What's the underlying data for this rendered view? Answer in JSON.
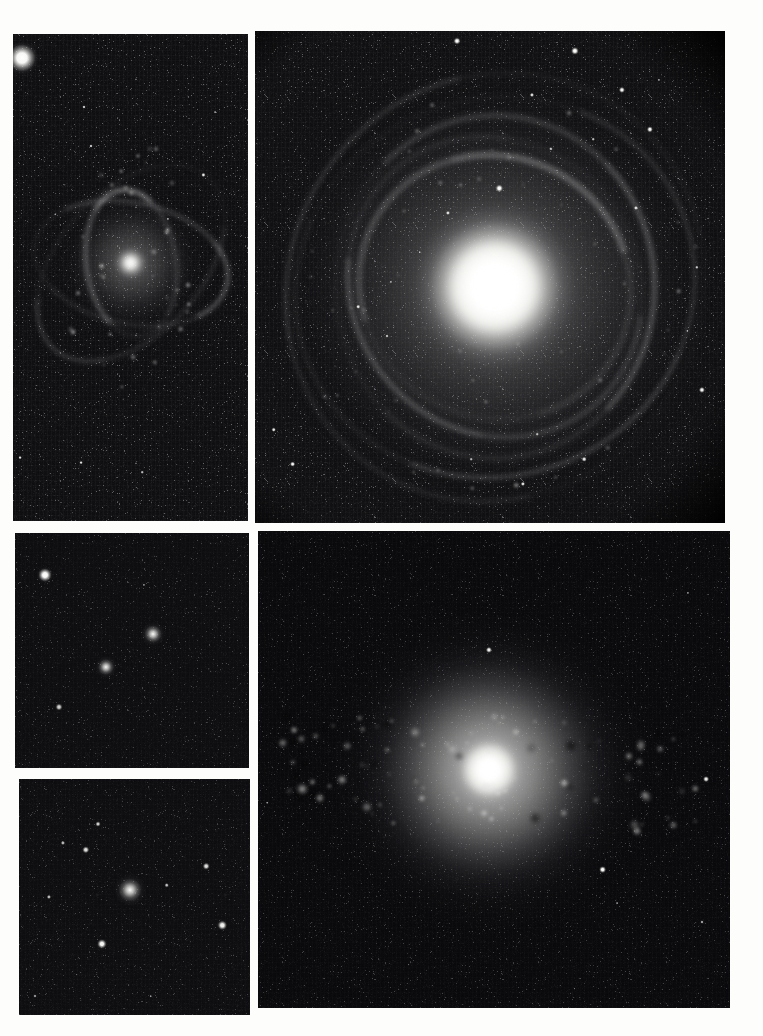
{
  "figure": {
    "kind": "astronomical-image-plate",
    "medium": "scanned photographic/CCD plate, greyscale",
    "width_px": 763,
    "height_px": 1036,
    "background_color": "#fdfdfc",
    "sky_color": "#08080a",
    "source_color": "#ffffff",
    "panel_count": 5,
    "caption": ""
  },
  "panels": [
    {
      "id": "panel-top-left",
      "name": "top-left-field",
      "position": "top-left",
      "label": "",
      "x": 13,
      "y": 34,
      "w": 235,
      "h": 487,
      "content": "Small barred/flocculent spiral galaxy low-left of centre in a sparse star field; a saturated bright star clips the upper-left corner.",
      "object_type": "spiral galaxy",
      "sky_level": "#0a0a0c",
      "grain": "strong",
      "vignette": "none",
      "stars": [
        {
          "name": "saturated-corner-star",
          "cx": 4,
          "cy": 5,
          "r": 17,
          "brightness": 1.0
        },
        {
          "name": "star",
          "cx": 30,
          "cy": 15,
          "r": 2.0,
          "brightness": 0.75
        },
        {
          "name": "star",
          "cx": 33,
          "cy": 23,
          "r": 2.0,
          "brightness": 0.72
        },
        {
          "name": "star",
          "cx": 86,
          "cy": 16,
          "r": 1.4,
          "brightness": 0.5
        },
        {
          "name": "star",
          "cx": 81,
          "cy": 29,
          "r": 2.6,
          "brightness": 0.88
        },
        {
          "name": "star",
          "cx": 66,
          "cy": 38,
          "r": 1.6,
          "brightness": 0.55
        },
        {
          "name": "star",
          "cx": 18,
          "cy": 37,
          "r": 1.2,
          "brightness": 0.4
        },
        {
          "name": "star",
          "cx": 22,
          "cy": 31,
          "r": 1.1,
          "brightness": 0.35
        },
        {
          "name": "star",
          "cx": 3,
          "cy": 87,
          "r": 2.4,
          "brightness": 0.82
        },
        {
          "name": "star",
          "cx": 29,
          "cy": 88,
          "r": 2.4,
          "brightness": 0.85
        },
        {
          "name": "star",
          "cx": 55,
          "cy": 90,
          "r": 1.8,
          "brightness": 0.6
        },
        {
          "name": "star",
          "cx": 70,
          "cy": 70,
          "r": 1.0,
          "brightness": 0.3
        },
        {
          "name": "star",
          "cx": 47,
          "cy": 75,
          "r": 0.9,
          "brightness": 0.26
        },
        {
          "name": "star",
          "cx": 62,
          "cy": 59,
          "r": 1.0,
          "brightness": 0.28
        },
        {
          "name": "star",
          "cx": 90,
          "cy": 63,
          "r": 0.9,
          "brightness": 0.24
        }
      ],
      "galaxy": {
        "name": "spiral-galaxy-small",
        "cx": 50,
        "cy": 47,
        "core_r": 7,
        "disk_rx": 31,
        "disk_ry": 26,
        "rotation_deg": -28,
        "morphology": "spiral with bright knots / HII regions along arms"
      }
    },
    {
      "id": "panel-top-right",
      "name": "top-right-field",
      "position": "top-right",
      "label": "",
      "x": 255,
      "y": 31,
      "w": 470,
      "h": 492,
      "content": "Large face-on grand-design spiral galaxy with very bright compact nucleus, mottled spiral arms and many resolved knots; circular vignette edge cuts the image corners.",
      "object_type": "face-on spiral galaxy",
      "sky_level": "#0b0b0d",
      "grain": "strong",
      "vignette": "circular field edge at upper-right, lower-right and lower-left corners",
      "stars": [
        {
          "name": "star",
          "cx": 43,
          "cy": 2,
          "r": 4.0,
          "brightness": 1.0
        },
        {
          "name": "star",
          "cx": 68,
          "cy": 4,
          "r": 4.6,
          "brightness": 1.0
        },
        {
          "name": "star",
          "cx": 78,
          "cy": 12,
          "r": 3.6,
          "brightness": 0.95
        },
        {
          "name": "star",
          "cx": 86,
          "cy": 10,
          "r": 1.6,
          "brightness": 0.5
        },
        {
          "name": "star",
          "cx": 59,
          "cy": 13,
          "r": 2.6,
          "brightness": 0.8
        },
        {
          "name": "star",
          "cx": 84,
          "cy": 20,
          "r": 3.6,
          "brightness": 0.95
        },
        {
          "name": "star",
          "cx": 72,
          "cy": 22,
          "r": 1.8,
          "brightness": 0.58
        },
        {
          "name": "star",
          "cx": 63,
          "cy": 24,
          "r": 2.2,
          "brightness": 0.66
        },
        {
          "name": "star",
          "cx": 52,
          "cy": 32,
          "r": 4.2,
          "brightness": 1.0
        },
        {
          "name": "star",
          "cx": 90,
          "cy": 30,
          "r": 1.4,
          "brightness": 0.45
        },
        {
          "name": "star",
          "cx": 81,
          "cy": 36,
          "r": 2.6,
          "brightness": 0.78
        },
        {
          "name": "star",
          "cx": 41,
          "cy": 37,
          "r": 2.6,
          "brightness": 0.8
        },
        {
          "name": "star",
          "cx": 35,
          "cy": 45,
          "r": 1.8,
          "brightness": 0.55
        },
        {
          "name": "star",
          "cx": 29,
          "cy": 51,
          "r": 1.6,
          "brightness": 0.5
        },
        {
          "name": "star",
          "cx": 22,
          "cy": 56,
          "r": 2.8,
          "brightness": 0.85
        },
        {
          "name": "star",
          "cx": 28,
          "cy": 62,
          "r": 2.0,
          "brightness": 0.62
        },
        {
          "name": "star",
          "cx": 94,
          "cy": 48,
          "r": 2.2,
          "brightness": 0.7
        },
        {
          "name": "star",
          "cx": 92,
          "cy": 61,
          "r": 1.6,
          "brightness": 0.5
        },
        {
          "name": "star",
          "cx": 95,
          "cy": 73,
          "r": 3.6,
          "brightness": 0.95
        },
        {
          "name": "star",
          "cx": 60,
          "cy": 82,
          "r": 1.8,
          "brightness": 0.55
        },
        {
          "name": "star",
          "cx": 70,
          "cy": 87,
          "r": 2.8,
          "brightness": 0.85
        },
        {
          "name": "star",
          "cx": 57,
          "cy": 92,
          "r": 2.6,
          "brightness": 0.82
        },
        {
          "name": "star",
          "cx": 46,
          "cy": 87,
          "r": 1.8,
          "brightness": 0.52
        },
        {
          "name": "star",
          "cx": 4,
          "cy": 81,
          "r": 2.8,
          "brightness": 0.88
        },
        {
          "name": "star",
          "cx": 8,
          "cy": 88,
          "r": 3.4,
          "brightness": 0.95
        },
        {
          "name": "star",
          "cx": 13,
          "cy": 77,
          "r": 1.3,
          "brightness": 0.4
        },
        {
          "name": "star",
          "cx": 6,
          "cy": 47,
          "r": 1.1,
          "brightness": 0.3
        },
        {
          "name": "star",
          "cx": 11,
          "cy": 38,
          "r": 1.0,
          "brightness": 0.26
        },
        {
          "name": "star",
          "cx": 17,
          "cy": 68,
          "r": 1.0,
          "brightness": 0.28
        },
        {
          "name": "star",
          "cx": 37,
          "cy": 92,
          "r": 1.2,
          "brightness": 0.34
        }
      ],
      "galaxy": {
        "name": "grand-design-spiral",
        "cx": 51,
        "cy": 52,
        "core_r": 14,
        "disk_rx": 46,
        "disk_ry": 43,
        "rotation_deg": 18,
        "morphology": "face-on multi-arm spiral, bright amorphous bulge, knotty arms"
      }
    },
    {
      "id": "panel-mid-left",
      "name": "mid-left-field",
      "position": "middle-left",
      "label": "",
      "x": 15,
      "y": 533,
      "w": 234,
      "h": 235,
      "content": "Sparse field: two compact fuzzy objects near the centre plus a bright star at upper left and a faint star at lower left.",
      "object_type": "star field with compact galaxies",
      "sky_level": "#0a0a0c",
      "grain": "medium",
      "vignette": "none",
      "stars": [
        {
          "name": "bright-star",
          "cx": 13,
          "cy": 18,
          "r": 8.0,
          "brightness": 1.0
        },
        {
          "name": "faint-star",
          "cx": 19,
          "cy": 74,
          "r": 4.0,
          "brightness": 0.72
        },
        {
          "name": "star",
          "cx": 55,
          "cy": 22,
          "r": 1.6,
          "brightness": 0.35
        },
        {
          "name": "star",
          "cx": 83,
          "cy": 58,
          "r": 1.1,
          "brightness": 0.22
        }
      ],
      "fuzzies": [
        {
          "name": "compact-galaxy-a",
          "cx": 59,
          "cy": 43,
          "r": 12.0,
          "brightness": 1.0
        },
        {
          "name": "compact-galaxy-b",
          "cx": 39,
          "cy": 57,
          "r": 11.0,
          "brightness": 0.95
        }
      ]
    },
    {
      "id": "panel-bottom-left",
      "name": "bottom-left-field",
      "position": "bottom-left",
      "label": "",
      "x": 19,
      "y": 779,
      "w": 231,
      "h": 236,
      "content": "Compact elliptical/fuzzy galaxy at the centre surrounded by roughly eight field stars of varying brightness.",
      "object_type": "compact galaxy with field stars",
      "sky_level": "#0a0a0c",
      "grain": "medium",
      "vignette": "none",
      "stars": [
        {
          "name": "star",
          "cx": 34,
          "cy": 19,
          "r": 3.0,
          "brightness": 0.72
        },
        {
          "name": "star",
          "cx": 29,
          "cy": 30,
          "r": 4.2,
          "brightness": 0.82
        },
        {
          "name": "star",
          "cx": 19,
          "cy": 27,
          "r": 2.6,
          "brightness": 0.58
        },
        {
          "name": "star",
          "cx": 81,
          "cy": 37,
          "r": 3.8,
          "brightness": 0.8
        },
        {
          "name": "star",
          "cx": 64,
          "cy": 45,
          "r": 2.8,
          "brightness": 0.62
        },
        {
          "name": "star",
          "cx": 13,
          "cy": 50,
          "r": 2.6,
          "brightness": 0.58
        },
        {
          "name": "star",
          "cx": 88,
          "cy": 62,
          "r": 5.2,
          "brightness": 0.92
        },
        {
          "name": "star",
          "cx": 36,
          "cy": 70,
          "r": 5.6,
          "brightness": 0.96
        },
        {
          "name": "star",
          "cx": 7,
          "cy": 92,
          "r": 2.0,
          "brightness": 0.4
        },
        {
          "name": "star",
          "cx": 57,
          "cy": 92,
          "r": 1.8,
          "brightness": 0.36
        },
        {
          "name": "star",
          "cx": 25,
          "cy": 83,
          "r": 1.2,
          "brightness": 0.24
        }
      ],
      "fuzzies": [
        {
          "name": "central-compact-galaxy",
          "cx": 48,
          "cy": 47,
          "r": 16.0,
          "brightness": 1.0
        }
      ]
    },
    {
      "id": "panel-bottom-right",
      "name": "bottom-right-field",
      "position": "bottom-right",
      "label": "",
      "x": 258,
      "y": 531,
      "w": 472,
      "h": 477,
      "content": "Highly inclined spiral galaxy spanning the frame horizontally, with a bright compact nucleus, strong mottled dust lanes and many bright HII knots in the arms; a handful of field stars below.",
      "object_type": "inclined spiral galaxy",
      "sky_level": "#060608",
      "grain": "medium",
      "vignette": "none",
      "stars": [
        {
          "name": "star",
          "cx": 49,
          "cy": 25,
          "r": 3.6,
          "brightness": 0.92
        },
        {
          "name": "star",
          "cx": 91,
          "cy": 13,
          "r": 1.6,
          "brightness": 0.38
        },
        {
          "name": "star",
          "cx": 95,
          "cy": 52,
          "r": 3.4,
          "brightness": 0.9
        },
        {
          "name": "star",
          "cx": 2,
          "cy": 57,
          "r": 1.8,
          "brightness": 0.4
        },
        {
          "name": "star",
          "cx": 73,
          "cy": 71,
          "r": 4.4,
          "brightness": 1.0
        },
        {
          "name": "star",
          "cx": 76,
          "cy": 78,
          "r": 1.4,
          "brightness": 0.4
        },
        {
          "name": "star",
          "cx": 94,
          "cy": 82,
          "r": 2.0,
          "brightness": 0.5
        },
        {
          "name": "star",
          "cx": 32,
          "cy": 91,
          "r": 1.2,
          "brightness": 0.26
        },
        {
          "name": "star",
          "cx": 67,
          "cy": 96,
          "r": 1.2,
          "brightness": 0.26
        }
      ],
      "galaxy": {
        "name": "inclined-spiral-galaxy",
        "cx": 49,
        "cy": 50,
        "core_r": 11,
        "disk_rx": 47,
        "disk_ry": 16,
        "rotation_deg": -8,
        "morphology": "inclined spiral, prominent dust lanes and bright knots"
      }
    }
  ]
}
